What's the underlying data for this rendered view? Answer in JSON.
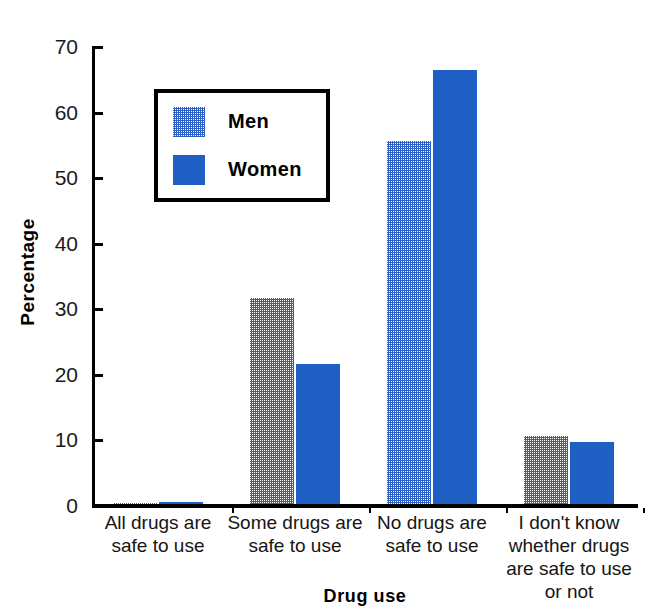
{
  "chart_data": {
    "type": "bar",
    "title": "",
    "xlabel": "Drug use",
    "ylabel": "Percentage",
    "ylim": [
      0,
      70
    ],
    "yticks": [
      0,
      10,
      20,
      30,
      40,
      50,
      60,
      70
    ],
    "ytick_labels": [
      "0",
      "10",
      "20",
      "30",
      "40",
      "50",
      "60",
      "70"
    ],
    "grid": false,
    "legend_position": "upper-left-inside",
    "categories": [
      "All drugs are\nsafe to use",
      "Some drugs are\nsafe to use",
      "No drugs are\nsafe to use",
      "I don't know\nwhether drugs\nare safe to use\nor not"
    ],
    "category_lines": [
      [
        "All drugs are",
        "safe to use"
      ],
      [
        "Some drugs are",
        "safe to use"
      ],
      [
        "No drugs are",
        "safe to use"
      ],
      [
        "I don't know",
        "whether drugs",
        "are safe to use",
        "or not"
      ]
    ],
    "series": [
      {
        "name": "Men",
        "color": "#7b93dd",
        "pattern": "dotted-blue",
        "values": [
          0.5,
          31.7,
          55.7,
          10.7
        ]
      },
      {
        "name": "Women",
        "color": "#1f5ec3",
        "pattern": "solid",
        "values": [
          0.6,
          21.7,
          66.5,
          9.8
        ]
      }
    ]
  },
  "legend": {
    "entries": [
      {
        "label": "Men",
        "swatch": "men-swatch-icon"
      },
      {
        "label": "Women",
        "swatch": "women-swatch-icon"
      }
    ]
  },
  "axes": {
    "y_title": "Percentage",
    "x_title": "Drug use"
  },
  "colors": {
    "men_bar": "#7b93dd",
    "women_bar": "#1f5ec3",
    "axis": "#000000",
    "background": "#ffffff"
  }
}
